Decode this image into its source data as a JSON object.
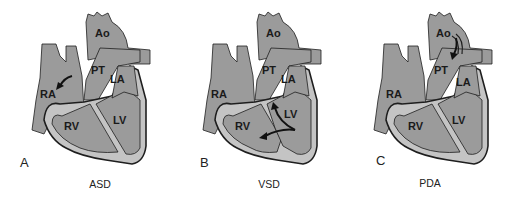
{
  "figure": {
    "colors": {
      "heart_fill": "#9b9b9b",
      "wall_fill": "#c4c4c4",
      "outline": "#1e1e1e",
      "background": "#ffffff"
    },
    "panels": [
      {
        "letter": "A",
        "caption": "ASD",
        "labels": {
          "ao": "Ao",
          "pt": "PT",
          "la": "LA",
          "ra": "RA",
          "rv": "RV",
          "lv": "LV"
        },
        "defect": "atrial-septal-arrow"
      },
      {
        "letter": "B",
        "caption": "VSD",
        "labels": {
          "ao": "Ao",
          "pt": "PT",
          "la": "LA",
          "ra": "RA",
          "rv": "RV",
          "lv": "LV"
        },
        "defect": "ventricular-septal-arrows"
      },
      {
        "letter": "C",
        "caption": "PDA",
        "labels": {
          "ao": "Ao",
          "pt": "PT",
          "la": "LA",
          "ra": "RA",
          "rv": "RV",
          "lv": "LV"
        },
        "defect": "ductus-arrow"
      }
    ]
  }
}
